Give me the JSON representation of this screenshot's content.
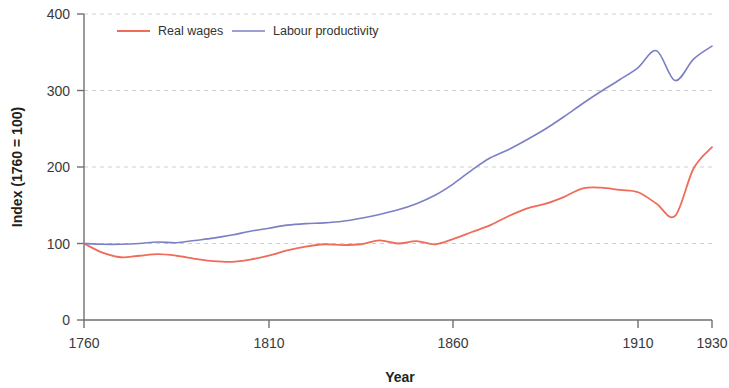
{
  "chart_data": {
    "type": "line",
    "title": "",
    "subtitle": "",
    "xlabel": "Year",
    "ylabel": "Index (1760 = 100)",
    "xlim": [
      1760,
      1930
    ],
    "ylim": [
      0,
      400
    ],
    "xticks": [
      1760,
      1810,
      1860,
      1910,
      1930
    ],
    "yticks": [
      0,
      100,
      200,
      300,
      400
    ],
    "xtick_labels": [
      "1760",
      "1810",
      "1860",
      "1910",
      "1930"
    ],
    "ytick_labels": [
      "0",
      "100",
      "200",
      "300",
      "400"
    ],
    "grid": "horizontal-dashed",
    "legend_position": "top-left-inside",
    "colors": {
      "real_wages": "#ef6b5a",
      "labour_productivity": "#7b80c4",
      "axis": "#6f6f6f",
      "grid": "#cfcfcf",
      "text": "#231f20"
    },
    "x": [
      1760,
      1765,
      1770,
      1775,
      1780,
      1785,
      1790,
      1795,
      1800,
      1805,
      1810,
      1815,
      1820,
      1825,
      1830,
      1835,
      1840,
      1845,
      1850,
      1855,
      1860,
      1865,
      1870,
      1875,
      1880,
      1885,
      1890,
      1895,
      1900,
      1905,
      1910,
      1915,
      1920,
      1925,
      1930
    ],
    "series": [
      {
        "name": "Real wages",
        "color": "#ef6b5a",
        "values": [
          100,
          88,
          82,
          84,
          86,
          84,
          80,
          77,
          76,
          79,
          84,
          91,
          96,
          99,
          98,
          99,
          104,
          100,
          103,
          99,
          106,
          115,
          124,
          136,
          146,
          152,
          161,
          172,
          173,
          170,
          167,
          152,
          136,
          198,
          226
        ]
      },
      {
        "name": "Labour productivity",
        "color": "#7b80c4",
        "values": [
          100,
          99,
          99,
          100,
          102,
          101,
          104,
          107,
          111,
          116,
          120,
          124,
          126,
          127,
          129,
          133,
          138,
          144,
          152,
          163,
          178,
          196,
          212,
          223,
          236,
          250,
          266,
          283,
          299,
          314,
          330,
          352,
          313,
          341,
          358
        ]
      }
    ],
    "annotations": []
  },
  "legend": {
    "items": [
      {
        "label": "Real wages",
        "swatch": "line-swatch-red"
      },
      {
        "label": "Labour productivity",
        "swatch": "line-swatch-blue"
      }
    ]
  },
  "axes": {
    "y_title": "Index (1760 = 100)",
    "x_title": "Year"
  }
}
